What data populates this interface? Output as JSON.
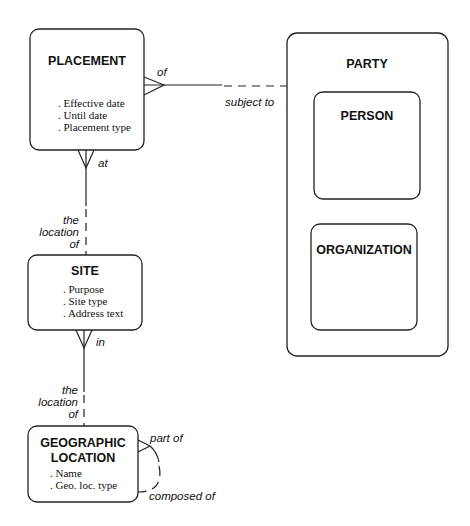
{
  "entities": {
    "placement": {
      "name": "PLACEMENT",
      "attributes": [
        ". Effective date",
        ". Until date",
        ". Placement type"
      ]
    },
    "party": {
      "name": "PARTY"
    },
    "person": {
      "name": "PERSON"
    },
    "organization": {
      "name": "ORGANIZATION"
    },
    "site": {
      "name": "SITE",
      "attributes": [
        ". Purpose",
        ". Site type",
        ". Address text"
      ]
    },
    "geographic_location": {
      "name_line1": "GEOGRAPHIC",
      "name_line2": "LOCATION",
      "attributes": [
        ". Name",
        ". Geo. loc. type"
      ]
    }
  },
  "relationships": {
    "placement_party": {
      "from_label": "of",
      "to_label": "subject to"
    },
    "placement_site": {
      "from_label": "at",
      "to_label_line1": "the",
      "to_label_line2": "location",
      "to_label_line3": "of"
    },
    "site_geo": {
      "from_label": "in",
      "to_label_line1": "the",
      "to_label_line2": "location",
      "to_label_line3": "of"
    },
    "geo_recursive": {
      "from_label": "part of",
      "to_label": "composed of"
    }
  }
}
